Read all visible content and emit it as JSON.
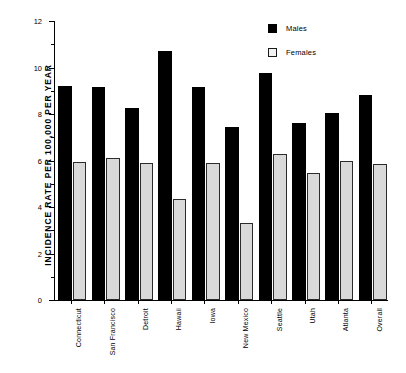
{
  "chart_data": {
    "type": "bar",
    "title": "",
    "xlabel": "",
    "ylabel": "INCIDENCE  RATE  PER  100,000  PER  YEAR",
    "ylim": [
      0,
      12
    ],
    "ytick_labels": [
      "0",
      "2",
      "4",
      "6",
      "8",
      "10",
      "12"
    ],
    "ytick_values": [
      0,
      2,
      4,
      6,
      8,
      10,
      12
    ],
    "yminor_values": [
      1,
      3,
      5,
      7,
      9,
      11
    ],
    "grid": false,
    "legend_position": "top-right",
    "categories": [
      "Connecticut",
      "San Francisco",
      "Detroit",
      "Hawaii",
      "Iowa",
      "New Mexico",
      "Seattle",
      "Utah",
      "Atlanta",
      "Overall"
    ],
    "series": [
      {
        "name": "Males",
        "color": "#000000",
        "values": [
          9.2,
          9.15,
          8.25,
          10.7,
          9.15,
          7.45,
          9.75,
          7.6,
          8.05,
          8.8
        ]
      },
      {
        "name": "Females",
        "color": "#d9d9d9",
        "values": [
          5.95,
          6.1,
          5.9,
          4.35,
          5.9,
          3.3,
          6.3,
          5.45,
          6.0,
          5.85
        ]
      }
    ]
  }
}
